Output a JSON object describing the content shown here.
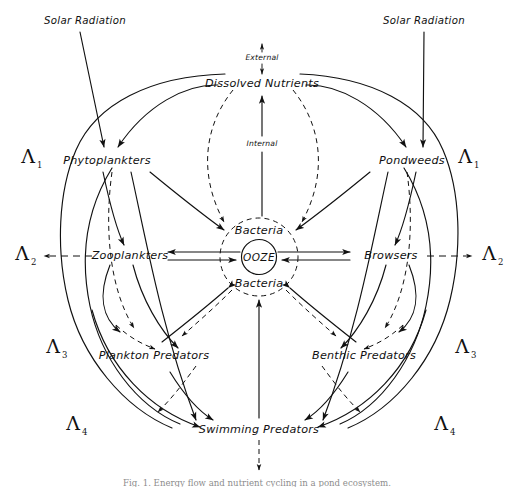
{
  "figure": {
    "domain": "diagram",
    "kind": "hand-drawn ecological energy flow diagram",
    "background_color": "#ffffff",
    "ink_color": "#111111",
    "caption": "Fig. 1. Energy flow and nutrient cycling in a pond ecosystem."
  },
  "nodes": {
    "dissolved_nutrients": "Dissolved Nutrients",
    "phytoplankters": "Phytoplankters",
    "pondweeds": "Pondweeds",
    "zooplankters": "Zooplankters",
    "browsers": "Browsers",
    "bacteria_top": "Bacteria",
    "bacteria_bottom": "Bacteria",
    "ooze": "OOZE",
    "plankton_predators": "Plankton Predators",
    "benthic_predators": "Benthic Predators",
    "swimming_predators": "Swimming Predators"
  },
  "inputs": {
    "solar_left": "Solar Radiation",
    "solar_right": "Solar Radiation"
  },
  "flux_labels": {
    "external": "External",
    "internal": "Internal"
  },
  "loss_terms": {
    "left": [
      {
        "symbol": "Λ",
        "subscript": "1"
      },
      {
        "symbol": "Λ",
        "subscript": "2"
      },
      {
        "symbol": "Λ",
        "subscript": "3"
      },
      {
        "symbol": "Λ",
        "subscript": "4"
      }
    ],
    "right": [
      {
        "symbol": "Λ",
        "subscript": "1"
      },
      {
        "symbol": "Λ",
        "subscript": "2"
      },
      {
        "symbol": "Λ",
        "subscript": "3"
      },
      {
        "symbol": "Λ",
        "subscript": "4"
      }
    ]
  },
  "legend_note": {
    "solid": "solid arrow = energy / material transfer",
    "dashed": "dashed arrow = loss or nutrient return"
  }
}
